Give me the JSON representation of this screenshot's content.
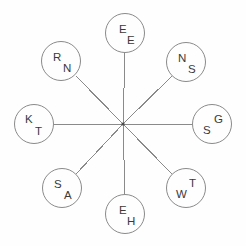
{
  "diagram": {
    "type": "radial-spoke-node-diagram",
    "canvas": {
      "width": 246,
      "height": 246,
      "background": "#fefefe"
    },
    "stroke_color": "#8a8a8a",
    "text_color": "#3a3a3a",
    "hub": {
      "x": 123,
      "y": 124,
      "label": ""
    },
    "node_radius": 20,
    "nodes": [
      {
        "id": "node-n",
        "position": "top",
        "angle_deg": 90,
        "cx": 125,
        "cy": 33,
        "letter_1": "E",
        "letter_2": "E",
        "letter_1_x": 13,
        "letter_1_y": 10,
        "letter_2_x": 21,
        "letter_2_y": 21
      },
      {
        "id": "node-ne",
        "position": "top-right",
        "angle_deg": 45,
        "cx": 186,
        "cy": 62,
        "letter_1": "N",
        "letter_2": "S",
        "letter_1_x": 11,
        "letter_1_y": 10,
        "letter_2_x": 21,
        "letter_2_y": 21
      },
      {
        "id": "node-e",
        "position": "right",
        "angle_deg": 0,
        "cx": 212,
        "cy": 124,
        "letter_1": "G",
        "letter_2": "S",
        "letter_1_x": 21,
        "letter_1_y": 9,
        "letter_2_x": 10,
        "letter_2_y": 20
      },
      {
        "id": "node-se",
        "position": "bottom-right",
        "angle_deg": 315,
        "cx": 186,
        "cy": 188,
        "letter_1": "T",
        "letter_2": "W",
        "letter_1_x": 22,
        "letter_1_y": 9,
        "letter_2_x": 9,
        "letter_2_y": 20
      },
      {
        "id": "node-s",
        "position": "bottom",
        "angle_deg": 270,
        "cx": 125,
        "cy": 214,
        "letter_1": "E",
        "letter_2": "H",
        "letter_1_x": 13,
        "letter_1_y": 10,
        "letter_2_x": 21,
        "letter_2_y": 21
      },
      {
        "id": "node-sw",
        "position": "bottom-left",
        "angle_deg": 225,
        "cx": 62,
        "cy": 188,
        "letter_1": "S",
        "letter_2": "A",
        "letter_1_x": 11,
        "letter_1_y": 10,
        "letter_2_x": 21,
        "letter_2_y": 21
      },
      {
        "id": "node-w",
        "position": "left",
        "angle_deg": 180,
        "cx": 34,
        "cy": 124,
        "letter_1": "K",
        "letter_2": "T",
        "letter_1_x": 10,
        "letter_1_y": 9,
        "letter_2_x": 20,
        "letter_2_y": 21
      },
      {
        "id": "node-nw",
        "position": "top-left",
        "angle_deg": 135,
        "cx": 61,
        "cy": 61,
        "letter_1": "R",
        "letter_2": "N",
        "letter_1_x": 11,
        "letter_1_y": 10,
        "letter_2_x": 21,
        "letter_2_y": 21
      }
    ],
    "spokes": [
      {
        "id": "spoke-n",
        "x1": 123,
        "y1": 124,
        "x2": 125,
        "y2": 53
      },
      {
        "id": "spoke-ne",
        "x1": 123,
        "y1": 124,
        "x2": 172,
        "y2": 76
      },
      {
        "id": "spoke-e",
        "x1": 123,
        "y1": 124,
        "x2": 192,
        "y2": 124
      },
      {
        "id": "spoke-se",
        "x1": 123,
        "y1": 124,
        "x2": 172,
        "y2": 174
      },
      {
        "id": "spoke-s",
        "x1": 123,
        "y1": 124,
        "x2": 125,
        "y2": 194
      },
      {
        "id": "spoke-sw",
        "x1": 123,
        "y1": 124,
        "x2": 76,
        "y2": 174
      },
      {
        "id": "spoke-w",
        "x1": 123,
        "y1": 124,
        "x2": 54,
        "y2": 124
      },
      {
        "id": "spoke-nw",
        "x1": 123,
        "y1": 124,
        "x2": 76,
        "y2": 76
      }
    ]
  }
}
